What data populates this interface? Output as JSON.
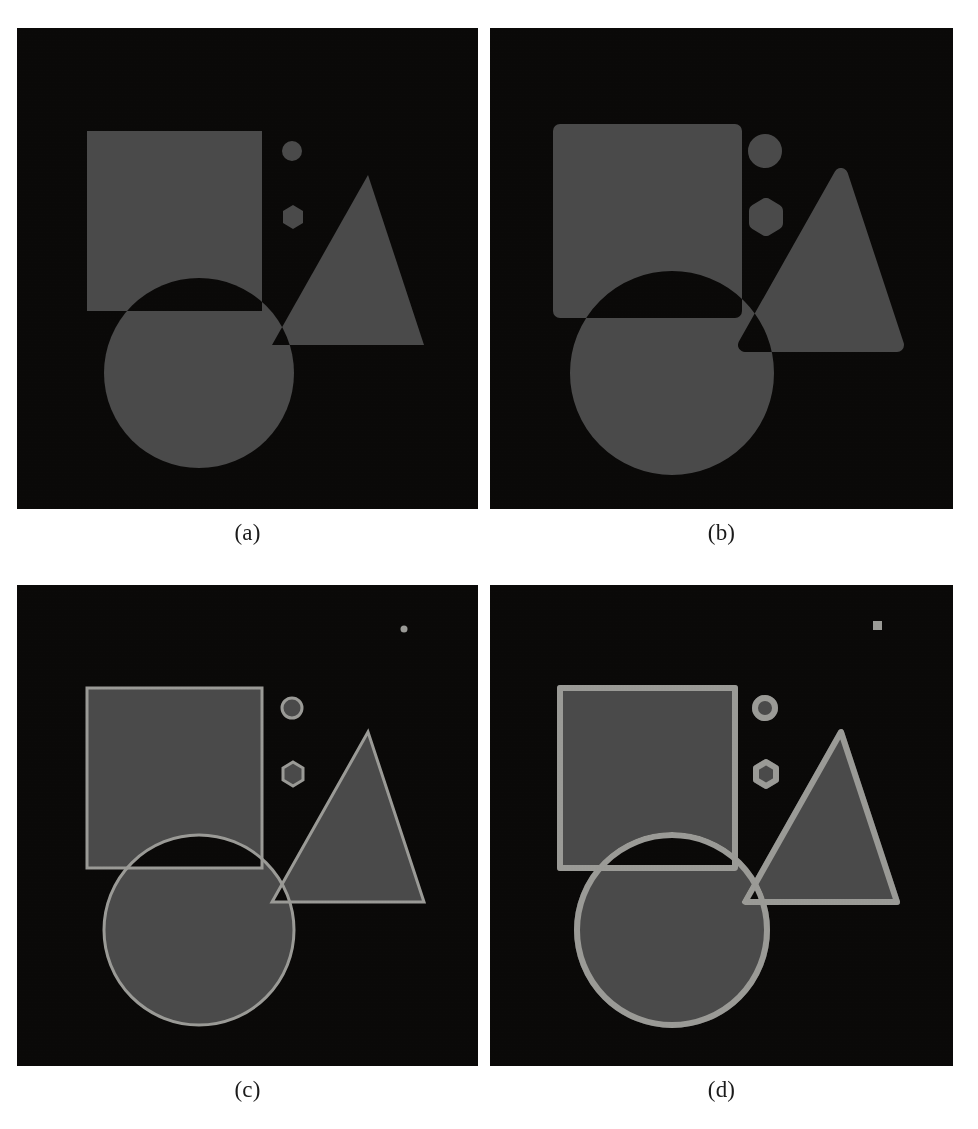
{
  "figure": {
    "type": "shape-composite-figure",
    "background_color": "#ffffff",
    "panel_background": "#0a0908",
    "fill_color": "#4a4a4a",
    "outline_color": "#9b9b97",
    "panels": [
      {
        "id": "a",
        "caption": "(a)",
        "description": "original shapes, XOR overlap, no outlines",
        "outline_width": 0,
        "dilation": 0,
        "has_marker": false,
        "marker_shape": "none"
      },
      {
        "id": "b",
        "caption": "(b)",
        "description": "dilated shapes, XOR overlap, no outlines",
        "outline_width": 0,
        "dilation": 7,
        "has_marker": false,
        "marker_shape": "none"
      },
      {
        "id": "c",
        "caption": "(c)",
        "description": "shapes with thin light outlines, small round marker",
        "outline_width": 3,
        "dilation": 0,
        "has_marker": true,
        "marker_shape": "circle",
        "marker_x": 387,
        "marker_y": 44,
        "marker_size": 7
      },
      {
        "id": "d",
        "caption": "(d)",
        "description": "shapes with thick light outlines, small square marker",
        "outline_width": 6,
        "dilation": 3,
        "has_marker": true,
        "marker_shape": "square",
        "marker_x": 387,
        "marker_y": 40,
        "marker_size": 9
      }
    ],
    "shapes": [
      {
        "name": "square",
        "kind": "rect",
        "x": 70,
        "y": 103,
        "width": 175,
        "height": 180
      },
      {
        "name": "circle",
        "kind": "circle",
        "cx": 182,
        "cy": 345,
        "r": 95
      },
      {
        "name": "triangle",
        "kind": "polygon",
        "points": "351,147 255,317 407,317"
      },
      {
        "name": "small-circle",
        "kind": "circle",
        "cx": 275,
        "cy": 123,
        "r": 10
      },
      {
        "name": "hexagon",
        "kind": "polygon",
        "points": "276,177 286,183 286,195 276,201 266,195 266,183"
      }
    ]
  }
}
